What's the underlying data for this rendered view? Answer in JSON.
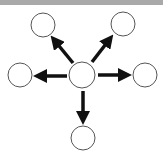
{
  "diagram": {
    "type": "hub-and-spoke",
    "colors": {
      "node_stroke": "#555555",
      "arrow": "#111111",
      "top_bar": "#a9a9a9"
    },
    "hub": {
      "id": "center",
      "cx": 82,
      "cy": 75,
      "r": 13
    },
    "nodes": [
      {
        "id": "top-left",
        "cx": 43,
        "cy": 25,
        "r": 12
      },
      {
        "id": "top-right",
        "cx": 123,
        "cy": 24,
        "r": 12
      },
      {
        "id": "left",
        "cx": 20,
        "cy": 75,
        "r": 12
      },
      {
        "id": "right",
        "cx": 145,
        "cy": 75,
        "r": 12
      },
      {
        "id": "bottom",
        "cx": 83,
        "cy": 138,
        "r": 12
      }
    ],
    "edges": [
      {
        "from": "center",
        "to": "top-left"
      },
      {
        "from": "center",
        "to": "top-right"
      },
      {
        "from": "center",
        "to": "left"
      },
      {
        "from": "center",
        "to": "right"
      },
      {
        "from": "center",
        "to": "bottom"
      }
    ]
  }
}
